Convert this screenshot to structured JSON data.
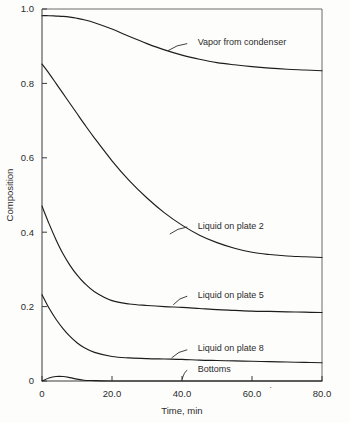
{
  "chart_data": {
    "type": "line",
    "title": "",
    "xlabel": "Time, min",
    "ylabel": "Composition",
    "xlim": [
      0,
      80
    ],
    "ylim": [
      0,
      1.0
    ],
    "grid": false,
    "legend_position": "inline-annotations",
    "x_ticks": [
      {
        "value": 0,
        "label": "0"
      },
      {
        "value": 20,
        "label": "20.0"
      },
      {
        "value": 40,
        "label": "40.0"
      },
      {
        "value": 60,
        "label": "60.0"
      },
      {
        "value": 80,
        "label": "80.0"
      }
    ],
    "y_ticks": [
      {
        "value": 0,
        "label": "0"
      },
      {
        "value": 0.2,
        "label": "0.2"
      },
      {
        "value": 0.4,
        "label": "0.4"
      },
      {
        "value": 0.6,
        "label": "0.6"
      },
      {
        "value": 0.8,
        "label": "0.8"
      },
      {
        "value": 1.0,
        "label": "1.0"
      }
    ],
    "x": [
      0,
      2,
      4,
      6,
      8,
      10,
      12,
      15,
      20,
      25,
      30,
      35,
      40,
      45,
      50,
      55,
      60,
      65,
      70,
      75,
      80
    ],
    "series": [
      {
        "name": "Vapor from condenser",
        "label": "Vapor from condenser",
        "label_x": 44.5,
        "label_y": 0.912,
        "leader_from": [
          41.5,
          0.907
        ],
        "leader_to": [
          36.0,
          0.888
        ],
        "values": [
          0.982,
          0.982,
          0.981,
          0.98,
          0.978,
          0.975,
          0.971,
          0.963,
          0.946,
          0.926,
          0.907,
          0.89,
          0.876,
          0.865,
          0.856,
          0.85,
          0.845,
          0.841,
          0.838,
          0.836,
          0.834
        ]
      },
      {
        "name": "Liquid on plate 2",
        "label": "Liquid on plate 2",
        "label_x": 44.5,
        "label_y": 0.418,
        "leader_from": [
          41.5,
          0.414
        ],
        "leader_to": [
          36.5,
          0.395
        ],
        "values": [
          0.852,
          0.827,
          0.8,
          0.773,
          0.746,
          0.719,
          0.692,
          0.653,
          0.592,
          0.538,
          0.492,
          0.452,
          0.419,
          0.392,
          0.372,
          0.357,
          0.346,
          0.34,
          0.336,
          0.334,
          0.332
        ]
      },
      {
        "name": "Liquid on plate 5",
        "label": "Liquid on plate 5",
        "label_x": 44.5,
        "label_y": 0.232,
        "leader_from": [
          41.5,
          0.228
        ],
        "leader_to": [
          37.5,
          0.205
        ],
        "values": [
          0.47,
          0.423,
          0.38,
          0.342,
          0.311,
          0.285,
          0.264,
          0.24,
          0.216,
          0.207,
          0.203,
          0.2,
          0.198,
          0.195,
          0.192,
          0.19,
          0.188,
          0.187,
          0.186,
          0.185,
          0.184
        ]
      },
      {
        "name": "Liquid on plate 8",
        "label": "Liquid on plate 8",
        "label_x": 44.5,
        "label_y": 0.088,
        "leader_from": [
          41.5,
          0.084
        ],
        "leader_to": [
          37.0,
          0.062
        ],
        "values": [
          0.232,
          0.196,
          0.166,
          0.141,
          0.12,
          0.103,
          0.09,
          0.077,
          0.066,
          0.062,
          0.06,
          0.059,
          0.058,
          0.056,
          0.055,
          0.054,
          0.053,
          0.052,
          0.051,
          0.05,
          0.049
        ]
      },
      {
        "name": "Bottoms",
        "label": "Bottoms",
        "label_x": 44.5,
        "label_y": 0.033,
        "leader_from": [
          41.5,
          0.029
        ],
        "leader_to": [
          40.0,
          0.004
        ],
        "values": [
          0.0,
          0.008,
          0.012,
          0.012,
          0.009,
          0.005,
          0.002,
          0.001,
          0.0,
          0.0,
          0.0,
          0.0,
          0.0,
          0.0,
          0.0,
          0.0,
          0.0,
          0.0,
          0.0,
          0.0,
          0.0
        ]
      }
    ],
    "artifact_mark": "˙"
  },
  "colors": {
    "curve": "#1d1d1d",
    "axis": "#3a3a3a",
    "frame": "#6b6b6b",
    "background": "#fdfdfc"
  }
}
